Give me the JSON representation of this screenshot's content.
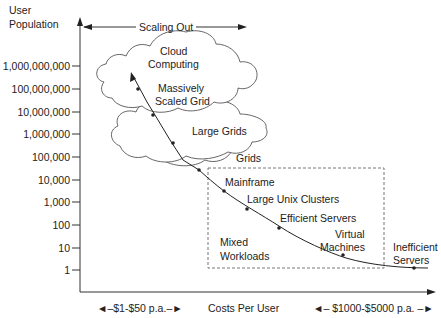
{
  "y_axis": {
    "title_line1": "User",
    "title_line2": "Population",
    "ticks": [
      "1,000,000,000",
      "100,000,000",
      "10,000,000",
      "1,000,000",
      "100,000",
      "10,000",
      "1,000",
      "100",
      "10",
      "1"
    ]
  },
  "x_axis": {
    "title": "Costs Per User",
    "low_range": "$1-$50 p.a.",
    "high_range": "$1000-$5000 p.a."
  },
  "scaling_out_label": "Scaling Out",
  "clouds": [
    {
      "line1": "Cloud",
      "line2": "Computing"
    },
    {
      "line1": "Massively",
      "line2": "Scaled Grid"
    },
    {
      "line1": "Large Grids"
    },
    {
      "line1": "Grids"
    }
  ],
  "curve_points": [
    {
      "label": "Mainframe"
    },
    {
      "label": "Large Unix Clusters"
    },
    {
      "label": "Efficient Servers"
    },
    {
      "label_line1": "Virtual",
      "label_line2": "Machines"
    },
    {
      "label_line1": "Inefficient",
      "label_line2": "Servers"
    }
  ],
  "mixed_workloads": {
    "line1": "Mixed",
    "line2": "Workloads"
  },
  "colors": {
    "line": "#222222",
    "cloud_stroke": "#555555",
    "dashed_box": "#666666"
  }
}
